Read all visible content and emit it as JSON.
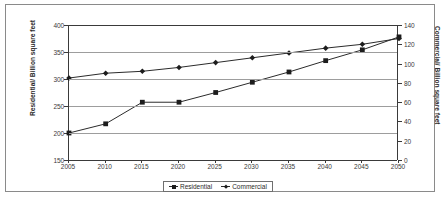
{
  "chart_data": {
    "type": "line",
    "title": "",
    "xlabel": "",
    "ylabel": "Residential/ Billion square feet",
    "ylabel_secondary": "Commercial/ Billion square feet",
    "x": [
      2005,
      2010,
      2015,
      2020,
      2025,
      2030,
      2035,
      2040,
      2045,
      2050
    ],
    "xtick_labels": [
      "2005",
      "2010",
      "2015",
      "2020",
      "2025",
      "2030",
      "2035",
      "2040",
      "2045",
      "2050"
    ],
    "ylim": [
      150,
      400
    ],
    "ytick_labels": [
      "150",
      "200",
      "250",
      "300",
      "350",
      "400"
    ],
    "ytick_values": [
      150,
      200,
      250,
      300,
      350,
      400
    ],
    "ylim_secondary": [
      0,
      140
    ],
    "ytick_labels_secondary": [
      "0",
      "20",
      "40",
      "60",
      "80",
      "100",
      "120",
      "140"
    ],
    "ytick_values_secondary": [
      0,
      20,
      40,
      60,
      80,
      100,
      120,
      140
    ],
    "grid": true,
    "legend_position": "bottom",
    "series": [
      {
        "name": "Residential",
        "axis": "left",
        "marker": "square",
        "units": "Billion square feet",
        "values": [
          200,
          217,
          257,
          257,
          275,
          294,
          313,
          334,
          354,
          378
        ]
      },
      {
        "name": "Commercial",
        "axis": "right",
        "marker": "diamond",
        "units": "Billion square feet",
        "values": [
          85,
          90,
          92,
          96,
          101,
          106,
          111,
          116,
          120,
          126
        ]
      }
    ],
    "colors": {
      "series_line": "#2b2b2b",
      "marker": "#1d1d1d",
      "gridline": "#9d9d9d",
      "axis": "#3a3a3a",
      "frame": "#8a8a8a",
      "background": "#ffffff"
    }
  },
  "legend": {
    "items": [
      {
        "label": "Residential",
        "marker": "square"
      },
      {
        "label": "Commercial",
        "marker": "diamond"
      }
    ]
  }
}
